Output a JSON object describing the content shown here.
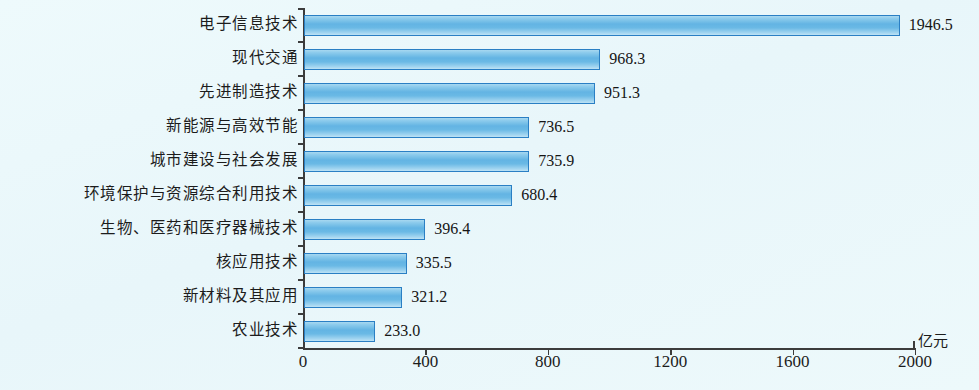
{
  "chart_data": {
    "type": "bar",
    "orientation": "horizontal",
    "title": "",
    "subtitle": "",
    "xlabel": "亿元",
    "ylabel": "",
    "unit_label": "亿元",
    "xlim": [
      0,
      2000
    ],
    "xticks": [
      0,
      400,
      800,
      1200,
      1600,
      2000
    ],
    "xtick_labels": [
      "0",
      "400",
      "800",
      "1200",
      "1600",
      "2000"
    ],
    "grid": false,
    "legend": null,
    "categories": [
      "电子信息技术",
      "现代交通",
      "先进制造技术",
      "新能源与高效节能",
      "城市建设与社会发展",
      "环境保护与资源综合利用技术",
      "生物、医药和医疗器械技术",
      "核应用技术",
      "新材料及其应用",
      "农业技术"
    ],
    "values": [
      1946.5,
      968.3,
      951.3,
      736.5,
      735.9,
      680.4,
      396.4,
      335.5,
      321.2,
      233.0
    ],
    "value_labels": [
      "1946.5",
      "968.3",
      "951.3",
      "736.5",
      "735.9",
      "680.4",
      "396.4",
      "335.5",
      "321.2",
      "233.0"
    ],
    "colors": {
      "bar_fill": "#6ab9e5",
      "bar_fill_light": "#bde2f5",
      "bar_border": "#2a7fc4",
      "axis": "#3c3c3c",
      "background": "#ebf8fb",
      "text": "#1c1c1c"
    }
  }
}
